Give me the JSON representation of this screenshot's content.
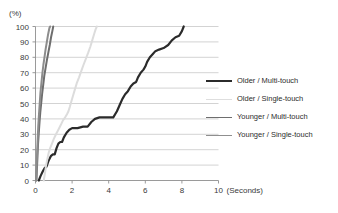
{
  "chart_data": {
    "type": "line",
    "title": "",
    "subtitle": "",
    "xlabel": "(Seconds)",
    "ylabel": "(%)",
    "xlim": [
      0,
      10
    ],
    "ylim": [
      0,
      100
    ],
    "x_ticks": [
      0,
      2,
      4,
      6,
      8,
      10
    ],
    "y_ticks": [
      0,
      10,
      20,
      30,
      40,
      50,
      60,
      70,
      80,
      90,
      100
    ],
    "grid": "horizontal",
    "legend_position": "right",
    "series": [
      {
        "name": "Older / Multi-touch",
        "color": "#2b2b2b",
        "width": 2.2,
        "points": [
          [
            0.18,
            0
          ],
          [
            0.28,
            3
          ],
          [
            0.4,
            6
          ],
          [
            0.5,
            8
          ],
          [
            0.6,
            9
          ],
          [
            0.72,
            13
          ],
          [
            0.85,
            16
          ],
          [
            0.95,
            17
          ],
          [
            1.05,
            17
          ],
          [
            1.15,
            21
          ],
          [
            1.25,
            24
          ],
          [
            1.35,
            25
          ],
          [
            1.45,
            25
          ],
          [
            1.55,
            28
          ],
          [
            1.7,
            31
          ],
          [
            1.85,
            33
          ],
          [
            2.0,
            34
          ],
          [
            2.3,
            34
          ],
          [
            2.6,
            35
          ],
          [
            2.85,
            35
          ],
          [
            3.05,
            38
          ],
          [
            3.25,
            40
          ],
          [
            3.5,
            41
          ],
          [
            3.9,
            41
          ],
          [
            4.25,
            41
          ],
          [
            4.45,
            45
          ],
          [
            4.6,
            49
          ],
          [
            4.75,
            53
          ],
          [
            4.9,
            56
          ],
          [
            5.05,
            58
          ],
          [
            5.2,
            61
          ],
          [
            5.35,
            63
          ],
          [
            5.5,
            64
          ],
          [
            5.6,
            67
          ],
          [
            5.75,
            70
          ],
          [
            5.9,
            72
          ],
          [
            6.0,
            74
          ],
          [
            6.1,
            77
          ],
          [
            6.25,
            80
          ],
          [
            6.4,
            82
          ],
          [
            6.55,
            84
          ],
          [
            6.75,
            85
          ],
          [
            7.0,
            86
          ],
          [
            7.25,
            88
          ],
          [
            7.45,
            91
          ],
          [
            7.65,
            93
          ],
          [
            7.85,
            94
          ],
          [
            8.0,
            97
          ],
          [
            8.1,
            100
          ]
        ]
      },
      {
        "name": "Older / Single-touch",
        "color": "#dcdcdc",
        "width": 2.0,
        "points": [
          [
            0.45,
            0
          ],
          [
            0.52,
            5
          ],
          [
            0.58,
            10
          ],
          [
            0.65,
            14
          ],
          [
            0.72,
            18
          ],
          [
            0.8,
            21
          ],
          [
            0.9,
            24
          ],
          [
            1.0,
            27
          ],
          [
            1.12,
            30
          ],
          [
            1.25,
            33
          ],
          [
            1.38,
            36
          ],
          [
            1.5,
            39
          ],
          [
            1.62,
            41
          ],
          [
            1.72,
            43
          ],
          [
            1.8,
            45
          ],
          [
            1.88,
            48
          ],
          [
            1.95,
            51
          ],
          [
            2.05,
            55
          ],
          [
            2.15,
            59
          ],
          [
            2.25,
            63
          ],
          [
            2.38,
            67
          ],
          [
            2.5,
            71
          ],
          [
            2.62,
            75
          ],
          [
            2.75,
            79
          ],
          [
            2.88,
            83
          ],
          [
            3.0,
            87
          ],
          [
            3.1,
            91
          ],
          [
            3.2,
            95
          ],
          [
            3.28,
            98
          ],
          [
            3.35,
            100
          ]
        ]
      },
      {
        "name": "Younger / Multi-touch",
        "color": "#6e6e6e",
        "width": 2.0,
        "points": [
          [
            0.05,
            0
          ],
          [
            0.08,
            8
          ],
          [
            0.11,
            16
          ],
          [
            0.14,
            24
          ],
          [
            0.18,
            31
          ],
          [
            0.22,
            38
          ],
          [
            0.26,
            44
          ],
          [
            0.31,
            50
          ],
          [
            0.36,
            56
          ],
          [
            0.42,
            62
          ],
          [
            0.48,
            68
          ],
          [
            0.55,
            73
          ],
          [
            0.62,
            78
          ],
          [
            0.7,
            83
          ],
          [
            0.78,
            88
          ],
          [
            0.85,
            93
          ],
          [
            0.92,
            97
          ],
          [
            0.97,
            100
          ]
        ]
      },
      {
        "name": "Younger / Single-touch",
        "color": "#8c8c8c",
        "width": 2.0,
        "points": [
          [
            0.04,
            0
          ],
          [
            0.06,
            9
          ],
          [
            0.09,
            18
          ],
          [
            0.12,
            27
          ],
          [
            0.15,
            35
          ],
          [
            0.19,
            43
          ],
          [
            0.23,
            50
          ],
          [
            0.27,
            57
          ],
          [
            0.32,
            63
          ],
          [
            0.37,
            69
          ],
          [
            0.43,
            75
          ],
          [
            0.49,
            80
          ],
          [
            0.55,
            85
          ],
          [
            0.62,
            90
          ],
          [
            0.69,
            95
          ],
          [
            0.76,
            99
          ],
          [
            0.8,
            100
          ]
        ]
      }
    ]
  },
  "legend": {
    "items": [
      {
        "label": "Older / Multi-touch",
        "color": "#2b2b2b",
        "width": "2.4px"
      },
      {
        "label": "Older / Single-touch",
        "color": "#dedede",
        "width": "1.8px"
      },
      {
        "label": "Younger / Multi-touch",
        "color": "#6e6e6e",
        "width": "1.8px"
      },
      {
        "label": "Younger / Single-touch",
        "color": "#8f8f8f",
        "width": "1.8px"
      }
    ]
  },
  "axes": {
    "y_unit": "(%)",
    "x_unit": "(Seconds)",
    "y_tick_labels": [
      "100",
      "90",
      "80",
      "70",
      "60",
      "50",
      "40",
      "30",
      "20",
      "10",
      "0"
    ],
    "x_tick_labels": [
      "0",
      "2",
      "4",
      "6",
      "8",
      "10"
    ]
  },
  "colors": {
    "grid": "#c8c8c8",
    "axis": "#8f8f8f",
    "text": "#3a3a3a",
    "background": "#ffffff"
  }
}
